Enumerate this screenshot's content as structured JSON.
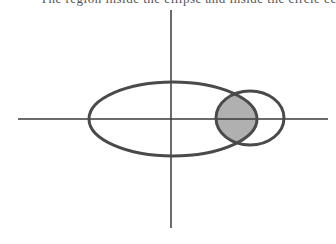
{
  "caption": "The region inside the ellipse and inside the circle centered at (a,b).",
  "colors": {
    "stroke": "#4a4a4a",
    "axis": "#3a3a3a",
    "fill": "#b0b0b0",
    "background": "#ffffff"
  },
  "diagram": {
    "axes": {
      "horizontal": {
        "x1": 18,
        "x2": 328,
        "y": 119
      },
      "vertical": {
        "x": 171,
        "y1": 10,
        "y2": 228
      }
    },
    "ellipse": {
      "cx": 173,
      "cy": 119,
      "rx": 84,
      "ry": 37
    },
    "circle": {
      "cx": 250,
      "cy": 118,
      "rx": 34,
      "ry": 27
    },
    "shaded_region": "intersection of ellipse and circle"
  }
}
